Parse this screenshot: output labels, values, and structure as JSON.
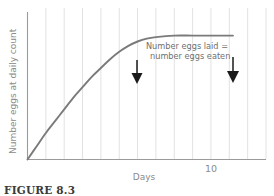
{
  "figure": {
    "caption": "FIGURE 8.3",
    "background_color": "#ffffff"
  },
  "chart_data": {
    "type": "line",
    "title": "",
    "xlabel": "Days",
    "ylabel": "Number eggs at daily count",
    "xlim": [
      0,
      13
    ],
    "ylim": [
      0,
      100
    ],
    "grid": true,
    "grid_axis": "x",
    "grid_color": "#e2e2e2",
    "legend_position": "none",
    "curve_color": "#7a7a7a",
    "axis_color": "#9a9a9a",
    "xticks": [
      0,
      1,
      2,
      3,
      4,
      5,
      6,
      7,
      8,
      9,
      10,
      11,
      12,
      13
    ],
    "xtick_labels": [
      "",
      "",
      "",
      "",
      "",
      "",
      "",
      "",
      "",
      "",
      "10",
      "",
      "",
      ""
    ],
    "yticks": [],
    "ytick_labels": [],
    "series": [
      {
        "name": "eggs at daily count",
        "x": [
          0,
          0.5,
          1,
          1.5,
          2,
          2.5,
          3,
          3.5,
          4,
          4.5,
          5,
          5.5,
          6,
          6.5,
          7,
          8,
          9,
          10,
          11,
          11.2
        ],
        "y": [
          0,
          9,
          18,
          26,
          34,
          42,
          49,
          56,
          62,
          68,
          73,
          77,
          80,
          82,
          83,
          84,
          84,
          84,
          84,
          84
        ]
      }
    ],
    "annotations": [
      {
        "name": "equilibrium-note",
        "line1": "Number eggs laid =",
        "line2": "number eggs eaten",
        "x": 9.0,
        "y": 96
      },
      {
        "name": "arrow-left",
        "type": "arrow",
        "direction": "down",
        "x": 6.25,
        "y_from": 97,
        "y_to": 86
      },
      {
        "name": "arrow-right",
        "type": "arrow",
        "direction": "down",
        "x": 11.15,
        "y_from": 97,
        "y_to": 86
      }
    ]
  }
}
